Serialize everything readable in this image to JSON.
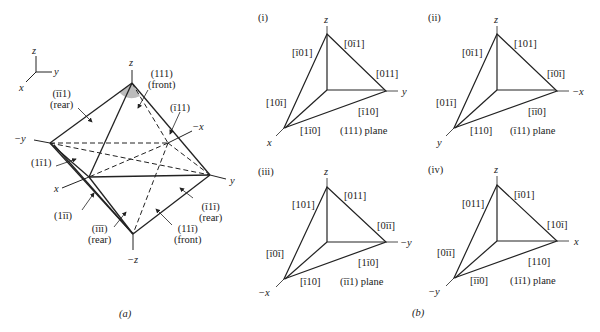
{
  "figure": {
    "part_a": {
      "caption": "(a)",
      "axes_legend": {
        "z": "z",
        "y": "y",
        "x": "x"
      },
      "vertex_labels": {
        "top": "z",
        "bottom": "−z",
        "left": "−y",
        "right": "y",
        "front": "x",
        "back": "−x"
      },
      "planes": [
        {
          "id": "p111",
          "label": "(111)",
          "sub": "(front)"
        },
        {
          "id": "pm1m11",
          "label": "(īī1)",
          "sub": "(rear)"
        },
        {
          "id": "pm111",
          "label": "(ī11)",
          "sub": ""
        },
        {
          "id": "p1m11",
          "label": "(1ī1)",
          "sub": ""
        },
        {
          "id": "p1m1m1",
          "label": "(1īī)",
          "sub": ""
        },
        {
          "id": "pm1m1m1",
          "label": "(īīī)",
          "sub": "(rear)"
        },
        {
          "id": "p11m1",
          "label": "(11ī)",
          "sub": "(front)"
        },
        {
          "id": "pm11m1",
          "label": "(ī1ī)",
          "sub": "(rear)"
        }
      ]
    },
    "part_b": {
      "caption": "(b)",
      "panels": [
        {
          "tag": "(i)",
          "plane": "(111) plane",
          "top": "z",
          "right": "y",
          "left": "x",
          "dirs": {
            "left_up": "[ī01]",
            "left_down": "[10ī]",
            "right_up": "[0ī1]",
            "right_down": "[011]",
            "bottom_right": "[ī10]",
            "bottom_left": "[1ī0]"
          }
        },
        {
          "tag": "(ii)",
          "plane": "(ī11) plane",
          "top": "z",
          "right": "−x",
          "left": "y",
          "dirs": {
            "left_up": "[0ī1]",
            "left_down": "[01ī]",
            "right_up": "[101]",
            "right_down": "[ī0ī]",
            "bottom_right": "[īī0]",
            "bottom_left": "[110]"
          }
        },
        {
          "tag": "(iii)",
          "plane": "(īī1) plane",
          "top": "z",
          "right": "−y",
          "left": "−x",
          "dirs": {
            "left_up": "[101]",
            "left_down": "[ī0ī]",
            "right_up": "[011]",
            "right_down": "[0īī]",
            "bottom_right": "[1ī0]",
            "bottom_left": "[ī10]"
          }
        },
        {
          "tag": "(iv)",
          "plane": "(1ī1) plane",
          "top": "z",
          "right": "x",
          "left": "−y",
          "dirs": {
            "left_up": "[011]",
            "left_down": "[0īī]",
            "right_up": "[ī01]",
            "right_down": "[10ī]",
            "bottom_right": "[110]",
            "bottom_left": "[īī0]"
          }
        }
      ]
    }
  }
}
